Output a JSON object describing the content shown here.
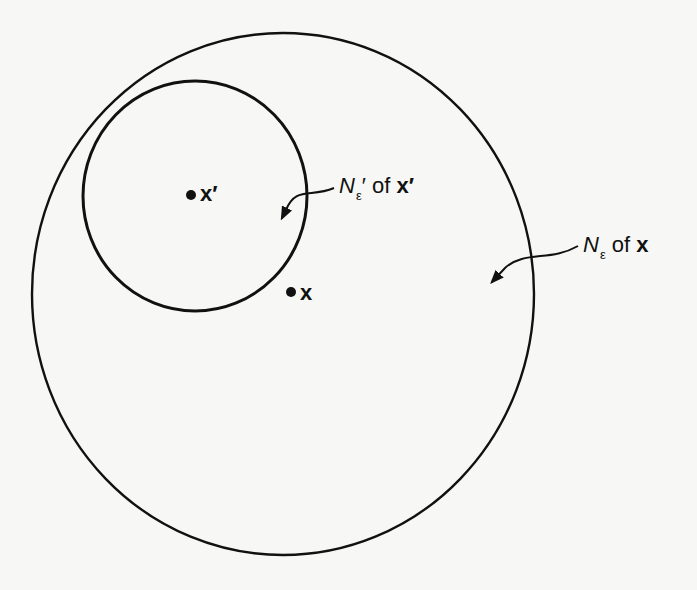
{
  "figure": {
    "background": "#f7f7f5",
    "stroke": "#111111",
    "outer_neighborhood": {
      "label_symbol": "N",
      "label_subscript": "ε",
      "label_rest": " of ",
      "label_point": "x"
    },
    "inner_neighborhood": {
      "label_symbol": "N",
      "label_subscript": "ε",
      "label_prime": "′",
      "label_rest": " of ",
      "label_point": "x′"
    },
    "points": {
      "x_prime": "x′",
      "x": "x"
    }
  }
}
